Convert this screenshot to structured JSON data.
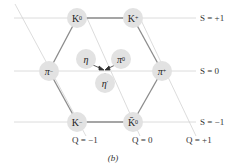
{
  "diagram": {
    "caption": "(b)",
    "colors": {
      "node_fill": "#e2e2e2",
      "hex_edge": "#8a8a8a",
      "grid_line": "#d0d0d0"
    },
    "particles": [
      {
        "id": "K0",
        "symbol": "K",
        "sup": "0",
        "x": 77,
        "y": 18,
        "S": 1,
        "Q": 0
      },
      {
        "id": "Kplus",
        "symbol": "K",
        "sup": "+",
        "x": 133,
        "y": 18,
        "S": 1,
        "Q": 1
      },
      {
        "id": "piminus",
        "symbol": "π",
        "sup": "−",
        "x": 49,
        "y": 71,
        "S": 0,
        "Q": -1
      },
      {
        "id": "piplus",
        "symbol": "π",
        "sup": "+",
        "x": 162,
        "y": 71,
        "S": 0,
        "Q": 1
      },
      {
        "id": "Kminus",
        "symbol": "K",
        "sup": "−",
        "x": 77,
        "y": 122,
        "S": -1,
        "Q": -1
      },
      {
        "id": "K0bar",
        "symbol": "K̄",
        "sup": "0",
        "x": 133,
        "y": 122,
        "S": -1,
        "Q": 0
      },
      {
        "id": "eta",
        "symbol": "η",
        "sup": "",
        "x": 86,
        "y": 59,
        "S": 0,
        "Q": 0
      },
      {
        "id": "pi0",
        "symbol": "π",
        "sup": "0",
        "x": 121,
        "y": 59,
        "S": 0,
        "Q": 0
      },
      {
        "id": "etaprime",
        "symbol": "η",
        "sup": "′",
        "x": 105,
        "y": 83,
        "S": 0,
        "Q": 0
      }
    ],
    "strangeness_labels": [
      {
        "text": "S = +1",
        "y": 18
      },
      {
        "text": "S = 0",
        "y": 71
      },
      {
        "text": "S = −1",
        "y": 122
      }
    ],
    "charge_labels": [
      {
        "text": "Q = −1",
        "x": 72
      },
      {
        "text": "Q = 0",
        "x": 132
      },
      {
        "text": "Q = +1",
        "x": 186
      }
    ]
  }
}
